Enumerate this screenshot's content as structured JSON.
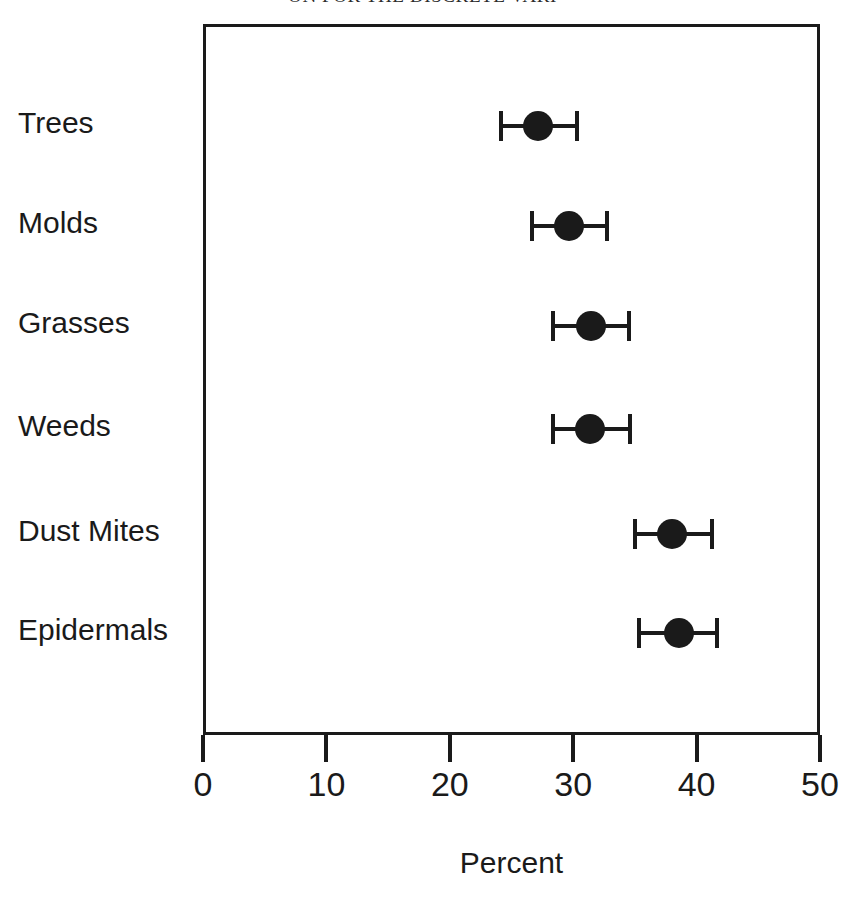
{
  "chart_data": {
    "type": "scatter",
    "orientation": "horizontal",
    "title": "ON FOR THE DISCRETE VARI",
    "xlabel": "Percent",
    "ylabel": "",
    "xlim": [
      0,
      50
    ],
    "xticks": [
      0,
      10,
      20,
      30,
      40,
      50
    ],
    "xticklabels": [
      "0",
      "10",
      "20",
      "30",
      "40",
      "50"
    ],
    "grid": false,
    "legend": false,
    "categories": [
      "Trees",
      "Molds",
      "Grasses",
      "Weeds",
      "Dust Mites",
      "Epidermals"
    ],
    "values": [
      26.9,
      29.4,
      31.2,
      31.1,
      37.8,
      38.3
    ],
    "error_low": [
      23.9,
      26.4,
      28.1,
      28.1,
      34.8,
      35.1
    ],
    "error_high": [
      30.1,
      32.5,
      34.3,
      34.4,
      41.0,
      41.4
    ],
    "points": [
      {
        "category": "Trees",
        "value": 26.9,
        "low": 23.9,
        "high": 30.1
      },
      {
        "category": "Molds",
        "value": 29.4,
        "low": 26.4,
        "high": 32.5
      },
      {
        "category": "Grasses",
        "value": 31.2,
        "low": 28.1,
        "high": 34.3
      },
      {
        "category": "Weeds",
        "value": 31.1,
        "low": 28.1,
        "high": 34.4
      },
      {
        "category": "Dust Mites",
        "value": 37.8,
        "low": 34.8,
        "high": 41.0
      },
      {
        "category": "Epidermals",
        "value": 38.3,
        "low": 35.1,
        "high": 41.4
      }
    ],
    "marker_color": "#1a1a1a",
    "axis_color": "#1a1a1a",
    "background_color": "#ffffff"
  }
}
